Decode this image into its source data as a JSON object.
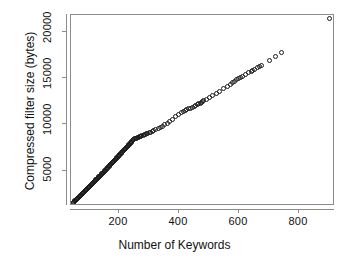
{
  "chart_data": {
    "type": "scatter",
    "title": "",
    "xlabel": "Number of Keywords",
    "ylabel": "Compressed filter size (bytes)",
    "xlim": [
      40,
      920
    ],
    "ylim": [
      1200,
      21800
    ],
    "xticks": [
      200,
      400,
      600,
      800
    ],
    "xticklabels": [
      "200",
      "400",
      "600",
      "800"
    ],
    "yticks": [
      5000,
      10000,
      15000,
      20000
    ],
    "yticklabels": [
      "5000",
      "10000",
      "15000",
      "20000"
    ],
    "grid": false,
    "legend": null,
    "marker": "open-circle",
    "marker_color": "#1a1a1a",
    "series": [
      {
        "name": "compressed filter size",
        "x": [
          45,
          47,
          49,
          51,
          53,
          55,
          57,
          59,
          61,
          63,
          65,
          67,
          69,
          71,
          73,
          75,
          77,
          79,
          81,
          83,
          85,
          87,
          89,
          91,
          93,
          95,
          97,
          99,
          101,
          103,
          105,
          107,
          109,
          111,
          113,
          115,
          117,
          119,
          121,
          123,
          125,
          127,
          129,
          131,
          133,
          135,
          137,
          139,
          141,
          143,
          145,
          147,
          149,
          151,
          153,
          155,
          157,
          159,
          161,
          163,
          165,
          167,
          169,
          171,
          173,
          175,
          177,
          179,
          181,
          183,
          185,
          187,
          189,
          191,
          193,
          195,
          197,
          199,
          201,
          203,
          205,
          207,
          209,
          211,
          213,
          215,
          217,
          219,
          221,
          223,
          225,
          227,
          229,
          231,
          233,
          235,
          237,
          239,
          241,
          243,
          246,
          249,
          252,
          255,
          258,
          261,
          264,
          267,
          270,
          273,
          276,
          280,
          284,
          288,
          292,
          296,
          300,
          305,
          310,
          316,
          322,
          330,
          338,
          345,
          352,
          360,
          368,
          378,
          388,
          398,
          408,
          414,
          420,
          426,
          432,
          438,
          444,
          450,
          456,
          462,
          466,
          470,
          474,
          478,
          482,
          490,
          500,
          512,
          524,
          536,
          548,
          560,
          570,
          578,
          585,
          592,
          598,
          604,
          612,
          622,
          632,
          640,
          646,
          652,
          660,
          668,
          676,
          700,
          720,
          742,
          900
        ],
        "y": [
          1500,
          1560,
          1620,
          1680,
          1740,
          1800,
          1865,
          1930,
          1995,
          2060,
          2120,
          2185,
          2250,
          2315,
          2380,
          2445,
          2510,
          2575,
          2640,
          2705,
          2770,
          2835,
          2900,
          2965,
          3030,
          3095,
          3160,
          3225,
          3290,
          3355,
          3420,
          3485,
          3550,
          3615,
          3680,
          3745,
          3810,
          3875,
          3940,
          4005,
          4070,
          4135,
          4200,
          4265,
          4330,
          4395,
          4460,
          4525,
          4590,
          4655,
          4720,
          4790,
          4860,
          4930,
          5000,
          5070,
          5140,
          5210,
          5280,
          5350,
          5420,
          5490,
          5560,
          5630,
          5700,
          5770,
          5840,
          5910,
          5980,
          6050,
          6120,
          6190,
          6260,
          6330,
          6400,
          6470,
          6540,
          6610,
          6680,
          6750,
          6820,
          6890,
          6960,
          7030,
          7100,
          7170,
          7240,
          7310,
          7380,
          7450,
          7520,
          7590,
          7660,
          7730,
          7800,
          7870,
          7940,
          8010,
          8080,
          8150,
          8250,
          8350,
          8430,
          8480,
          8530,
          8580,
          8620,
          8660,
          8700,
          8740,
          8780,
          8830,
          8880,
          8930,
          8980,
          9030,
          9080,
          9150,
          9220,
          9310,
          9400,
          9520,
          9660,
          9800,
          9940,
          10100,
          10300,
          10550,
          10800,
          11050,
          11300,
          11400,
          11500,
          11600,
          11680,
          11760,
          11850,
          11950,
          12050,
          12150,
          12230,
          12300,
          12380,
          12460,
          12550,
          12700,
          12900,
          13150,
          13380,
          13600,
          13850,
          14100,
          14300,
          14500,
          14650,
          14800,
          14920,
          15020,
          15180,
          15400,
          15600,
          15750,
          15850,
          15950,
          16100,
          16250,
          16400,
          16850,
          17300,
          17800,
          21400
        ]
      }
    ]
  },
  "axes": {
    "x_title": "Number of Keywords",
    "y_title": "Compressed filter size (bytes)"
  }
}
